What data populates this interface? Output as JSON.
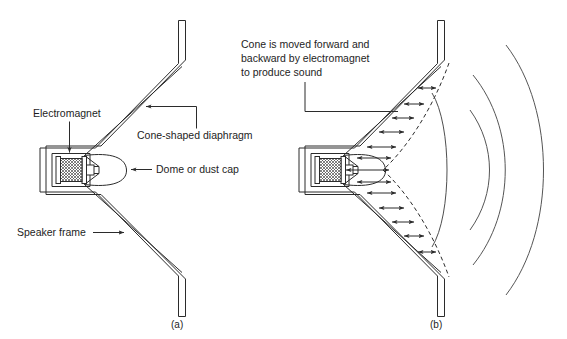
{
  "figure": {
    "background_color": "#ffffff",
    "line_color": "#2b2b2b",
    "wave_color": "#555555"
  },
  "panel_a": {
    "caption": "(a)",
    "labels": {
      "electromagnet": "Electromagnet",
      "cone": "Cone-shaped diaphragm",
      "dome": "Dome or dust cap",
      "frame": "Speaker frame"
    }
  },
  "panel_b": {
    "caption": "(b)",
    "note_line1": "Cone is moved forward and",
    "note_line2": "backward by electromagnet",
    "note_line3": "to produce sound",
    "sound_waves": 3,
    "motion_arrows": 13
  }
}
